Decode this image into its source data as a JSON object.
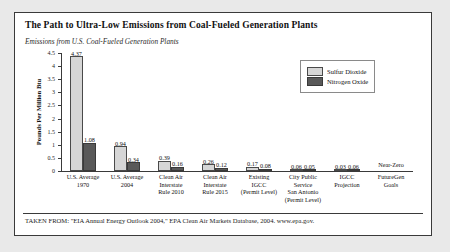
{
  "card": {
    "title": "The Path to Ultra-Low Emissions from Coal-Fueled Generation Plants",
    "subtitle": "Emissions from U.S. Coal-Fueled Generation Plants",
    "source": "TAKEN FROM: \"EIA Annual Energy Outlook 2004,\" EPA Clean Air Markets Database, 2004. www.epa.gov."
  },
  "legend": {
    "items": [
      {
        "label": "Sulfur Dioxide",
        "color": "#d6d6d6"
      },
      {
        "label": "Nitrogen Oxide",
        "color": "#595959"
      }
    ]
  },
  "annotations": {
    "near_zero": "Near-Zero"
  },
  "chart_data": {
    "type": "bar",
    "title": "The Path to Ultra-Low Emissions from Coal-Fueled Generation Plants",
    "subtitle": "Emissions from U.S. Coal-Fueled Generation Plants",
    "xlabel": "",
    "ylabel": "Pounds Per Million Btu",
    "ylim": [
      0,
      4.5
    ],
    "yticks": [
      "0",
      "0.5",
      "1",
      "1.5",
      "2",
      "2.5",
      "3",
      "3.5",
      "4",
      "4.5"
    ],
    "grid": false,
    "legend_position": "top-right",
    "categories": [
      "U.S. Average\n1970",
      "U.S. Average\n2004",
      "Clean Air\nInterstate\nRule 2010",
      "Clean Air\nInterstate\nRule 2015",
      "Existing\nIGCC\n(Permit Level)",
      "City Public\nService\nSan Antonio\n(Permit Level)",
      "IGCC\nProjection",
      "FutureGen\nGoals"
    ],
    "series": [
      {
        "name": "Sulfur Dioxide",
        "color": "#d6d6d6",
        "values": [
          4.37,
          0.94,
          0.39,
          0.26,
          0.17,
          0.06,
          0.03,
          null
        ],
        "labels": [
          "4.37",
          "0.94",
          "0.39",
          "0.26",
          "0.17",
          "0.06",
          "0.03",
          ""
        ]
      },
      {
        "name": "Nitrogen Oxide",
        "color": "#595959",
        "values": [
          1.08,
          0.34,
          0.16,
          0.12,
          0.08,
          0.05,
          0.06,
          null
        ],
        "labels": [
          "1.08",
          "0.34",
          "0.16",
          "0.12",
          "0.08",
          "0.05",
          "0.06",
          ""
        ]
      }
    ]
  }
}
